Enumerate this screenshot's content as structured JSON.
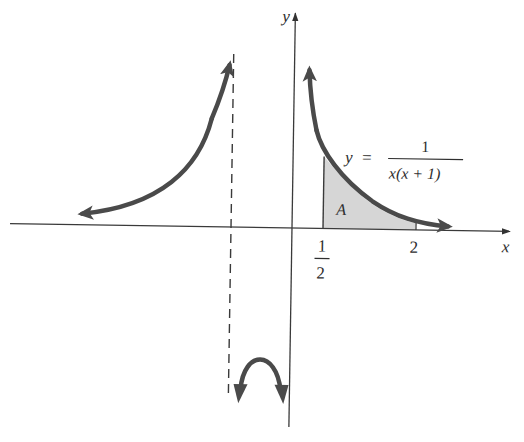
{
  "figure": {
    "title": "",
    "function_label": {
      "lhs": "y",
      "equals": "=",
      "numerator": "1",
      "denominator": "x(x + 1)"
    },
    "area_label": "A",
    "axes": {
      "x_label": "x",
      "y_label": "y"
    },
    "tick_labels": {
      "half_numerator": "1",
      "half_denominator": "2",
      "two": "2"
    },
    "vertical_asymptote": "x = -1 (dashed)",
    "shaded_region": {
      "from": "1/2",
      "to": "2",
      "label": "A"
    },
    "colors": {
      "curve": "#4a4a4a",
      "axis": "#3a3a3a",
      "shade": "#d6d6d6",
      "background": "#ffffff"
    }
  }
}
